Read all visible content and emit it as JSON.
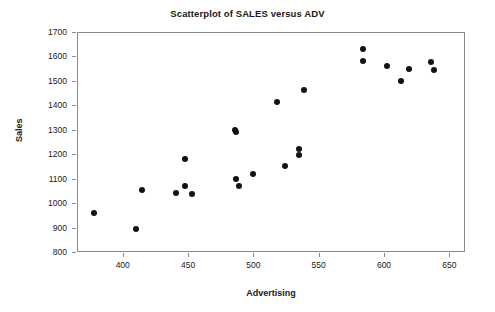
{
  "chart_data": {
    "type": "scatter",
    "title": "Scatterplot of SALES versus ADV",
    "xlabel": "Advertising",
    "ylabel": "Sales",
    "xlim": [
      365,
      662
    ],
    "ylim": [
      800,
      1700
    ],
    "xticks": [
      400,
      450,
      500,
      550,
      600,
      650
    ],
    "yticks": [
      800,
      900,
      1000,
      1100,
      1200,
      1300,
      1400,
      1500,
      1600,
      1700
    ],
    "grid": false,
    "legend": null,
    "marker": "filled-circle",
    "marker_color": "#111111",
    "frame_color": "#8a8a8a",
    "background_color": "#ffffff",
    "points": [
      {
        "x": 378,
        "y": 961
      },
      {
        "x": 410,
        "y": 894
      },
      {
        "x": 415,
        "y": 1053
      },
      {
        "x": 441,
        "y": 1042
      },
      {
        "x": 448,
        "y": 1182
      },
      {
        "x": 448,
        "y": 1070
      },
      {
        "x": 453,
        "y": 1037
      },
      {
        "x": 486,
        "y": 1299
      },
      {
        "x": 487,
        "y": 1292
      },
      {
        "x": 487,
        "y": 1100
      },
      {
        "x": 489,
        "y": 1071
      },
      {
        "x": 500,
        "y": 1120
      },
      {
        "x": 518,
        "y": 1414
      },
      {
        "x": 524,
        "y": 1153
      },
      {
        "x": 535,
        "y": 1222
      },
      {
        "x": 535,
        "y": 1198
      },
      {
        "x": 539,
        "y": 1463
      },
      {
        "x": 584,
        "y": 1632
      },
      {
        "x": 584,
        "y": 1582
      },
      {
        "x": 602,
        "y": 1562
      },
      {
        "x": 613,
        "y": 1501
      },
      {
        "x": 619,
        "y": 1548
      },
      {
        "x": 636,
        "y": 1578
      },
      {
        "x": 638,
        "y": 1546
      }
    ]
  }
}
